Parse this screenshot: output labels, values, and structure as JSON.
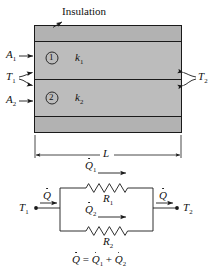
{
  "figure": {
    "title_label": "Insulation",
    "colors": {
      "slab_fill": "#b9b9b9",
      "insulation_fill": "#b0b0b0",
      "stroke": "#1a1a1a",
      "background": "#ffffff"
    }
  },
  "slab": {
    "insulation_label": "Insulation",
    "left_labels": [
      {
        "name": "A1",
        "base": "A",
        "sub": "1"
      },
      {
        "name": "T1",
        "base": "T",
        "sub": "1"
      },
      {
        "name": "A2",
        "base": "A",
        "sub": "2"
      }
    ],
    "right_labels": [
      {
        "name": "T2",
        "base": "T",
        "sub": "2"
      }
    ],
    "layers": [
      {
        "marker": "1",
        "conductivity_base": "k",
        "conductivity_sub": "1"
      },
      {
        "marker": "2",
        "conductivity_base": "k",
        "conductivity_sub": "2"
      }
    ],
    "dimension": {
      "name": "L",
      "label": "L"
    }
  },
  "circuit": {
    "node_left": {
      "base": "T",
      "sub": "1"
    },
    "node_right": {
      "base": "T",
      "sub": "2"
    },
    "flow_in": {
      "base": "Q",
      "sub": ""
    },
    "flow_out": {
      "base": "Q",
      "sub": ""
    },
    "branches": [
      {
        "flow_base": "Q",
        "flow_sub": "1",
        "resistor_base": "R",
        "resistor_sub": "1"
      },
      {
        "flow_base": "Q",
        "flow_sub": "2",
        "resistor_base": "R",
        "resistor_sub": "2"
      }
    ],
    "equation": {
      "lhs_base": "Q",
      "eq": "=",
      "term1_base": "Q",
      "term1_sub": "1",
      "plus": "+",
      "term2_base": "Q",
      "term2_sub": "2"
    }
  }
}
